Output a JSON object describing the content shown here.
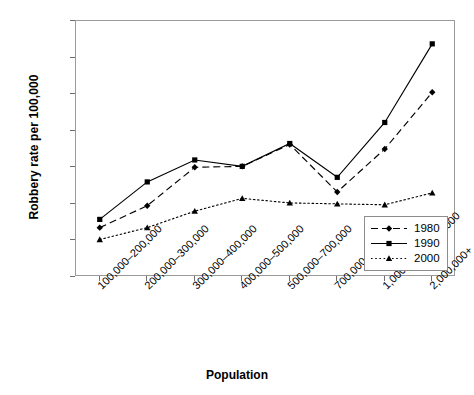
{
  "chart_data": {
    "type": "line",
    "title": "",
    "xlabel": "Population",
    "ylabel": "Robbery rate per 100,000",
    "categories": [
      "100,000–200,000",
      "200,000–300,000",
      "300,000–400,000",
      "400,000–500,000",
      "500,000–700,000",
      "700,000–1,000,000",
      "1,000,000–2,000,000",
      "2,000,000+"
    ],
    "series": [
      {
        "name": "1980",
        "values": [
          270,
          390,
          600,
          605,
          725,
          465,
          700,
          1010
        ],
        "marker": "diamond",
        "line": "dashed"
      },
      {
        "name": "1990",
        "values": [
          315,
          520,
          640,
          605,
          730,
          545,
          845,
          1275
        ],
        "marker": "square",
        "line": "solid"
      },
      {
        "name": "2000",
        "values": [
          205,
          270,
          360,
          430,
          405,
          400,
          395,
          460
        ],
        "marker": "triangle",
        "line": "dotted"
      }
    ],
    "ylim": [
      0,
      1400
    ],
    "yticks": [
      "0",
      "200",
      "400",
      "600",
      "800",
      "1,000",
      "1,200",
      "1,400"
    ],
    "ytick_values": [
      0,
      200,
      400,
      600,
      800,
      1000,
      1200,
      1400
    ],
    "grid": false,
    "legend_position": "bottom-right",
    "series_color": "#000000"
  }
}
